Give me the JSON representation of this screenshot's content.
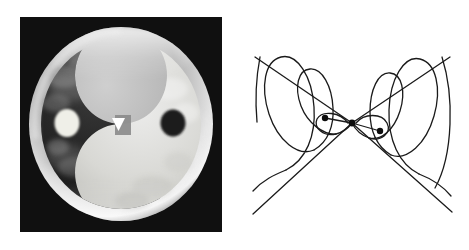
{
  "figure": {
    "width": 469,
    "height": 250,
    "background_color": "#ffffff",
    "panel_count": 2,
    "caption": ""
  },
  "left_panel": {
    "name": "yin-yang-sphere-photo",
    "description": "Grayscale photographic rendering of a translucent sphere bearing a yin-yang taijitu pattern",
    "frame": {
      "x": 20,
      "y": 17,
      "width": 202,
      "height": 215,
      "background_color": "#111111"
    },
    "sphere": {
      "center_x": 101,
      "center_y": 107,
      "radius_x": 92,
      "radius_y": 97,
      "rim_color": "#d8d8d8",
      "rim_highlight_color": "#f2f2f2"
    },
    "yin_half": {
      "label": "yin-dark-half",
      "color": "#2a2a2a",
      "position": "upper-left"
    },
    "yang_half": {
      "label": "yang-light-half",
      "color": "#d5d5d2",
      "position": "lower-right"
    },
    "dots": [
      {
        "label": "light-dot-in-dark-half",
        "center_x": 47,
        "center_y": 106,
        "radius": 13,
        "color": "#efefe8"
      },
      {
        "label": "dark-dot-in-light-half",
        "center_x": 153,
        "center_y": 106,
        "radius": 13,
        "color": "#1e1e1e"
      }
    ],
    "center_marker": {
      "label": "white-triangle-marker",
      "shape": "triangle-down",
      "center_x": 98,
      "center_y": 107,
      "size": 11,
      "color": "#ffffff",
      "backing_rect_color": "#8c8c8c"
    }
  },
  "right_panel": {
    "name": "double-cone-helix-diagram",
    "description": "Hand-drawn double cone (bow-tie / light cone) with helical spiral curves inside each cone and two dots joined by line segments at the shared vertex",
    "frame": {
      "x": 236,
      "y": 0,
      "width": 233,
      "height": 250,
      "background_color": "#ffffff"
    },
    "stroke_color": "#1a1a1a",
    "stroke_width": 1.3,
    "vertex": {
      "label": "cone-apex",
      "x": 116,
      "y": 123,
      "marker": "filled-dot",
      "radius": 3.4
    },
    "cones": [
      {
        "label": "left-cone",
        "direction": "opens-left",
        "upper_edge": [
          [
            116,
            123
          ],
          [
            19,
            57
          ]
        ],
        "lower_edge": [
          [
            116,
            123
          ],
          [
            19,
            213
          ]
        ],
        "helix_turns": 3,
        "helix_expanding": true
      },
      {
        "label": "right-cone",
        "direction": "opens-right",
        "upper_edge": [
          [
            116,
            123
          ],
          [
            213,
            57
          ]
        ],
        "lower_edge": [
          [
            116,
            123
          ],
          [
            213,
            213
          ]
        ],
        "helix_turns": 3,
        "helix_expanding": true
      }
    ],
    "marked_points": [
      {
        "label": "left-marked-dot",
        "x": 89,
        "y": 118,
        "radius": 3.2,
        "color": "#0d0d0d"
      },
      {
        "label": "right-marked-dot",
        "x": 144,
        "y": 131,
        "radius": 3.2,
        "color": "#0d0d0d"
      }
    ],
    "connector_segments": [
      {
        "label": "vertex-to-left-dot",
        "from": [
          116,
          123
        ],
        "to": [
          89,
          118
        ]
      },
      {
        "label": "vertex-to-right-dot",
        "from": [
          116,
          123
        ],
        "to": [
          144,
          131
        ]
      }
    ]
  }
}
